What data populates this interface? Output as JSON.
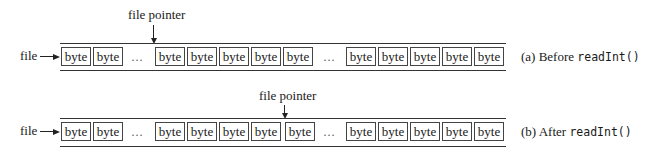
{
  "diagrams": [
    {
      "id": "before",
      "file_label": "file",
      "pointer_label": "file pointer",
      "cell_label": "byte",
      "ellipsis": "…",
      "caption_prefix": "(a) Before ",
      "caption_code": "readInt()",
      "pointer_at_cell_index": 2
    },
    {
      "id": "after",
      "file_label": "file",
      "pointer_label": "file pointer",
      "cell_label": "byte",
      "ellipsis": "…",
      "caption_prefix": "(b) After ",
      "caption_code": "readInt()",
      "pointer_at_cell_index": 6
    }
  ],
  "cells": [
    "byte",
    "byte",
    "byte",
    "byte",
    "byte",
    "byte",
    "byte",
    "byte",
    "byte",
    "byte",
    "byte",
    "byte"
  ]
}
